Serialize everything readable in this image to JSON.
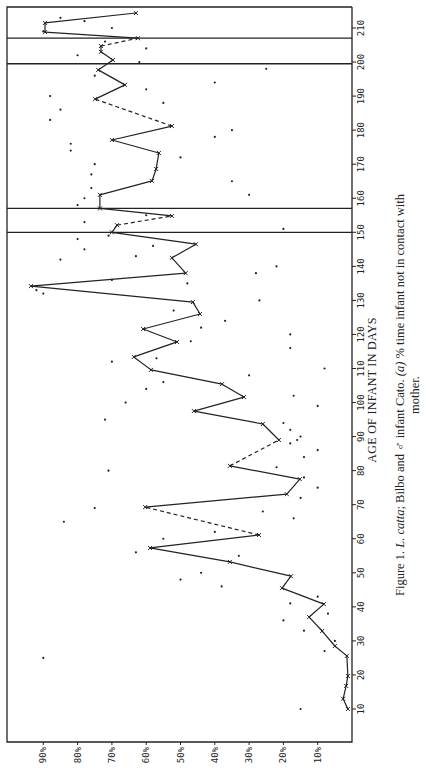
{
  "chart_data": {
    "type": "line",
    "orientation": "rotated-90-clockwise",
    "title": "",
    "xlabel": "AGE OF INFANT IN DAYS",
    "ylabel": "",
    "xlim": [
      5,
      215
    ],
    "ylim": [
      0,
      100
    ],
    "x_ticks": [
      10,
      20,
      30,
      40,
      50,
      60,
      70,
      80,
      90,
      100,
      110,
      120,
      130,
      140,
      150,
      160,
      170,
      180,
      190,
      200,
      210
    ],
    "y_ticks": [
      10,
      20,
      30,
      40,
      50,
      60,
      70,
      80,
      90
    ],
    "y_tick_labels": [
      "10%",
      "20%",
      "30%",
      "40%",
      "50%",
      "60%",
      "70%",
      "80%",
      "90%"
    ],
    "grid": false,
    "legend": null,
    "reference_lines_x": [
      150,
      157,
      199.5,
      207
    ],
    "series": [
      {
        "name": "% time infant not in contact with mother (running mean)",
        "style": "solid with dashed gaps",
        "points": [
          {
            "x": 10,
            "y": 1.2
          },
          {
            "x": 13,
            "y": 2.6
          },
          {
            "x": 16.8,
            "y": 1.7
          },
          {
            "x": 19.7,
            "y": 1.2
          },
          {
            "x": 25.6,
            "y": 1.5
          },
          {
            "x": 28.5,
            "y": 5
          },
          {
            "x": 32.9,
            "y": 8.7
          },
          {
            "x": 37,
            "y": 12.5
          },
          {
            "x": 40.8,
            "y": 8.2
          },
          {
            "x": 45.5,
            "y": 20.4
          },
          {
            "x": 49,
            "y": 17.8
          },
          {
            "x": 53.2,
            "y": 35.6
          },
          {
            "x": 57.3,
            "y": 58.9
          },
          {
            "x": 61.1,
            "y": 27.1,
            "dashed_to": true
          },
          {
            "x": 69.3,
            "y": 60.3
          },
          {
            "x": 73.1,
            "y": 19
          },
          {
            "x": 77.5,
            "y": 15.2
          },
          {
            "x": 81.4,
            "y": 35.6,
            "dashed_to": true
          },
          {
            "x": 89,
            "y": 21.3
          },
          {
            "x": 93.7,
            "y": 26
          },
          {
            "x": 97.5,
            "y": 46.1
          },
          {
            "x": 101.6,
            "y": 31.5
          },
          {
            "x": 105.4,
            "y": 37.9
          },
          {
            "x": 109.6,
            "y": 58.6
          },
          {
            "x": 113.4,
            "y": 63.6
          },
          {
            "x": 117.8,
            "y": 51
          },
          {
            "x": 121.6,
            "y": 60.9
          },
          {
            "x": 126,
            "y": 44.3
          },
          {
            "x": 129.5,
            "y": 46.4
          },
          {
            "x": 134.2,
            "y": 93.6
          },
          {
            "x": 138,
            "y": 48.5
          },
          {
            "x": 142.5,
            "y": 52.5
          },
          {
            "x": 146.5,
            "y": 45.5
          },
          {
            "x": 150,
            "y": 70
          },
          {
            "x": 152.1,
            "y": 68.5,
            "dashed_to": true
          },
          {
            "x": 154.8,
            "y": 52.5
          },
          {
            "x": 157,
            "y": 73.5
          },
          {
            "x": 161,
            "y": 73.5
          },
          {
            "x": 165.1,
            "y": 58.3
          },
          {
            "x": 168.6,
            "y": 57.1
          },
          {
            "x": 173.3,
            "y": 56.3
          },
          {
            "x": 177.1,
            "y": 70
          },
          {
            "x": 181.2,
            "y": 52.5,
            "dashed_to": true
          },
          {
            "x": 189.1,
            "y": 74.9
          },
          {
            "x": 193.3,
            "y": 66.2
          },
          {
            "x": 197.7,
            "y": 74
          },
          {
            "x": 200.6,
            "y": 69.7
          },
          {
            "x": 203,
            "y": 73.2
          },
          {
            "x": 204.7,
            "y": 73.2,
            "dashed_to": true
          },
          {
            "x": 207,
            "y": 62.4
          },
          {
            "x": 208.8,
            "y": 89.5
          },
          {
            "x": 211.5,
            "y": 89.5
          },
          {
            "x": 214.4,
            "y": 63
          }
        ]
      },
      {
        "name": "daily observations (scatter)",
        "style": "dots",
        "points": [
          {
            "x": 10,
            "y": 15
          },
          {
            "x": 25,
            "y": 90
          },
          {
            "x": 27,
            "y": 8
          },
          {
            "x": 30,
            "y": 5
          },
          {
            "x": 33,
            "y": 14
          },
          {
            "x": 36,
            "y": 20
          },
          {
            "x": 38,
            "y": 7
          },
          {
            "x": 41,
            "y": 18
          },
          {
            "x": 43,
            "y": 10
          },
          {
            "x": 46,
            "y": 38
          },
          {
            "x": 48,
            "y": 50
          },
          {
            "x": 50,
            "y": 44
          },
          {
            "x": 55,
            "y": 33
          },
          {
            "x": 56,
            "y": 63
          },
          {
            "x": 60,
            "y": 55
          },
          {
            "x": 62,
            "y": 40
          },
          {
            "x": 65,
            "y": 84
          },
          {
            "x": 66,
            "y": 17
          },
          {
            "x": 68,
            "y": 26
          },
          {
            "x": 69,
            "y": 75
          },
          {
            "x": 72,
            "y": 15
          },
          {
            "x": 75,
            "y": 10
          },
          {
            "x": 78,
            "y": 14
          },
          {
            "x": 80,
            "y": 71
          },
          {
            "x": 81,
            "y": 22
          },
          {
            "x": 84,
            "y": 14
          },
          {
            "x": 86,
            "y": 10
          },
          {
            "x": 88,
            "y": 18
          },
          {
            "x": 89,
            "y": 16
          },
          {
            "x": 90,
            "y": 15
          },
          {
            "x": 92,
            "y": 18
          },
          {
            "x": 94,
            "y": 20
          },
          {
            "x": 95,
            "y": 72
          },
          {
            "x": 99,
            "y": 10
          },
          {
            "x": 100,
            "y": 66
          },
          {
            "x": 102,
            "y": 17
          },
          {
            "x": 104,
            "y": 60
          },
          {
            "x": 106,
            "y": 55
          },
          {
            "x": 108,
            "y": 30
          },
          {
            "x": 110,
            "y": 8
          },
          {
            "x": 112,
            "y": 70
          },
          {
            "x": 113,
            "y": 57
          },
          {
            "x": 116,
            "y": 18
          },
          {
            "x": 118,
            "y": 47
          },
          {
            "x": 120,
            "y": 18
          },
          {
            "x": 122,
            "y": 44
          },
          {
            "x": 124,
            "y": 37
          },
          {
            "x": 127,
            "y": 52
          },
          {
            "x": 130,
            "y": 27
          },
          {
            "x": 132,
            "y": 90
          },
          {
            "x": 133,
            "y": 92
          },
          {
            "x": 135,
            "y": 48
          },
          {
            "x": 136,
            "y": 70
          },
          {
            "x": 138,
            "y": 28
          },
          {
            "x": 140,
            "y": 22
          },
          {
            "x": 142,
            "y": 85
          },
          {
            "x": 143,
            "y": 63
          },
          {
            "x": 145,
            "y": 78
          },
          {
            "x": 146,
            "y": 58
          },
          {
            "x": 148,
            "y": 80
          },
          {
            "x": 149,
            "y": 71
          },
          {
            "x": 151,
            "y": 20
          },
          {
            "x": 153,
            "y": 78
          },
          {
            "x": 155,
            "y": 60
          },
          {
            "x": 158,
            "y": 80
          },
          {
            "x": 160,
            "y": 78
          },
          {
            "x": 161,
            "y": 30
          },
          {
            "x": 163,
            "y": 76
          },
          {
            "x": 165,
            "y": 35
          },
          {
            "x": 167,
            "y": 76
          },
          {
            "x": 170,
            "y": 75
          },
          {
            "x": 172,
            "y": 50
          },
          {
            "x": 174,
            "y": 82
          },
          {
            "x": 176,
            "y": 82
          },
          {
            "x": 178,
            "y": 40
          },
          {
            "x": 180,
            "y": 35
          },
          {
            "x": 183,
            "y": 88
          },
          {
            "x": 186,
            "y": 85
          },
          {
            "x": 188,
            "y": 55
          },
          {
            "x": 190,
            "y": 88
          },
          {
            "x": 192,
            "y": 60
          },
          {
            "x": 194,
            "y": 40
          },
          {
            "x": 196,
            "y": 75
          },
          {
            "x": 198,
            "y": 25
          },
          {
            "x": 200,
            "y": 62
          },
          {
            "x": 202,
            "y": 80
          },
          {
            "x": 204,
            "y": 60
          },
          {
            "x": 206,
            "y": 72
          },
          {
            "x": 209,
            "y": 90
          },
          {
            "x": 210,
            "y": 70
          },
          {
            "x": 212,
            "y": 78
          },
          {
            "x": 213,
            "y": 85
          }
        ]
      }
    ],
    "caption": "Figure 1. L. catta; Bilbo and ♂ infant Cato. (a) % time infant not in contact with mother."
  },
  "labels": {
    "x_axis_title": "AGE OF INFANT IN DAYS",
    "caption_line1_prefix": "Figure 1. ",
    "caption_line1_species": "L. catta",
    "caption_line1_rest": "; Bilbo and ♂ infant Cato. ",
    "caption_line1_panel": "(a)",
    "caption_line1_end": " % time infant not in contact with",
    "caption_line2": "mother."
  }
}
